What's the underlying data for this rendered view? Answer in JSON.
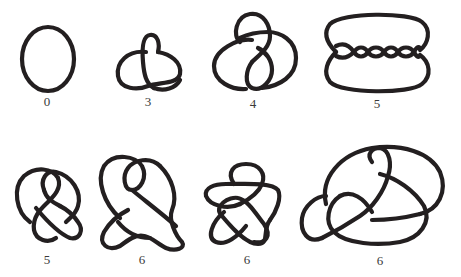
{
  "figure": {
    "stroke_color": "#231f20",
    "background": "#ffffff",
    "rows": [
      {
        "knots": [
          {
            "name": "unknot",
            "crossing_number": "0"
          },
          {
            "name": "trefoil",
            "crossing_number": "3"
          },
          {
            "name": "figure-eight",
            "crossing_number": "4"
          },
          {
            "name": "five-twist",
            "crossing_number": "5"
          }
        ]
      },
      {
        "knots": [
          {
            "name": "knot-5",
            "crossing_number": "5"
          },
          {
            "name": "knot-6a",
            "crossing_number": "6"
          },
          {
            "name": "knot-6b",
            "crossing_number": "6"
          },
          {
            "name": "knot-6c",
            "crossing_number": "6"
          }
        ]
      }
    ]
  }
}
